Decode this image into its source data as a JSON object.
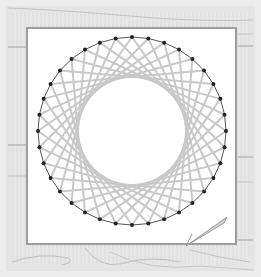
{
  "scene": {
    "description": "String art circle pattern on white paper over a light wooden board with a pen",
    "colors": {
      "board": "#e4e4e4",
      "board_edge": "#ececec",
      "wood_lines": "#bdbdbd",
      "paper": "#ffffff",
      "paper_border": "#9c9c9c",
      "thread": "#c8c8c8",
      "rim": "#555555",
      "pin": "#222222",
      "pen": "#9a9a9a"
    },
    "string_art": {
      "pins": 36,
      "skip": 11,
      "center_x": 132,
      "center_y": 131,
      "radius": 94
    },
    "pen": {
      "x1": 186,
      "y1": 246,
      "x2": 227,
      "y2": 217
    }
  }
}
